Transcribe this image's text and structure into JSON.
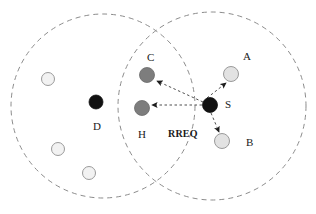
{
  "figure": {
    "type": "network-topology-diagram",
    "width": 316,
    "height": 214,
    "background": "#ffffff"
  },
  "colors": {
    "range_circle_stroke": "#8c8c8c",
    "source_node_fill": "#111111",
    "destination_node_fill": "#111111",
    "relay_node_fill": "#7d7d7d",
    "idle_node_fill": "#f2f2f2",
    "neighbor_node_fill": "#e2e2e2",
    "idle_node_stroke": "#9a9a9a",
    "arrow_stroke": "#3a3a3a",
    "label_color": "#1a1a1a"
  },
  "range_circles": [
    {
      "id": "range-d",
      "name": "left-transmission-range",
      "cx": 103,
      "cy": 106,
      "r": 92,
      "dash": "5 4"
    },
    {
      "id": "range-s",
      "name": "right-transmission-range",
      "cx": 212,
      "cy": 106,
      "r": 94,
      "dash": "5 4"
    }
  ],
  "nodes": [
    {
      "id": "S",
      "label": "S",
      "cx": 210,
      "cy": 105,
      "r": 7.5,
      "style": "source",
      "label_x": 225,
      "label_y": 99
    },
    {
      "id": "A",
      "label": "A",
      "cx": 231,
      "cy": 74,
      "r": 7.5,
      "style": "neighbor",
      "label_x": 243,
      "label_y": 51
    },
    {
      "id": "B",
      "label": "B",
      "cx": 222,
      "cy": 141,
      "r": 7.5,
      "style": "neighbor",
      "label_x": 246,
      "label_y": 137
    },
    {
      "id": "C",
      "label": "C",
      "cx": 147,
      "cy": 75,
      "r": 7.5,
      "style": "relay",
      "label_x": 147,
      "label_y": 52
    },
    {
      "id": "H",
      "label": "H",
      "cx": 142,
      "cy": 108,
      "r": 7.5,
      "style": "relay",
      "label_x": 138,
      "label_y": 129
    },
    {
      "id": "D",
      "label": "D",
      "cx": 96,
      "cy": 102,
      "r": 7.0,
      "style": "destination",
      "label_x": 93,
      "label_y": 121
    },
    {
      "id": "N1",
      "label": "",
      "cx": 48,
      "cy": 79,
      "r": 6.5,
      "style": "idle",
      "label_x": 0,
      "label_y": 0
    },
    {
      "id": "N2",
      "label": "",
      "cx": 58,
      "cy": 149,
      "r": 6.5,
      "style": "idle",
      "label_x": 0,
      "label_y": 0
    },
    {
      "id": "N3",
      "label": "",
      "cx": 89,
      "cy": 173,
      "r": 6.5,
      "style": "idle",
      "label_x": 0,
      "label_y": 0
    }
  ],
  "links": [
    {
      "id": "S-C",
      "name": "rreq-arrow-s-to-c",
      "from": "S",
      "to": "C",
      "x1": 203,
      "y1": 102,
      "x2": 157,
      "y2": 81,
      "dash": "2.5 2.5",
      "arrow": true
    },
    {
      "id": "S-H",
      "name": "rreq-arrow-s-to-h",
      "from": "S",
      "to": "H",
      "x1": 202,
      "y1": 105,
      "x2": 152,
      "y2": 105,
      "dash": "2.5 2.5",
      "arrow": true
    },
    {
      "id": "S-A",
      "name": "rreq-arrow-s-to-a",
      "from": "S",
      "to": "A",
      "x1": 207,
      "y1": 98,
      "x2": 226,
      "y2": 83,
      "dash": "2.5 2.5",
      "arrow": true
    },
    {
      "id": "S-B",
      "name": "rreq-arrow-s-to-b",
      "from": "S",
      "to": "B",
      "x1": 211,
      "y1": 113,
      "x2": 219,
      "y2": 132,
      "dash": "2.5 2.5",
      "arrow": true
    }
  ],
  "annotations": [
    {
      "id": "rreq",
      "name": "rreq-packet-label",
      "text": "RREQ",
      "x": 168,
      "y": 129
    }
  ]
}
